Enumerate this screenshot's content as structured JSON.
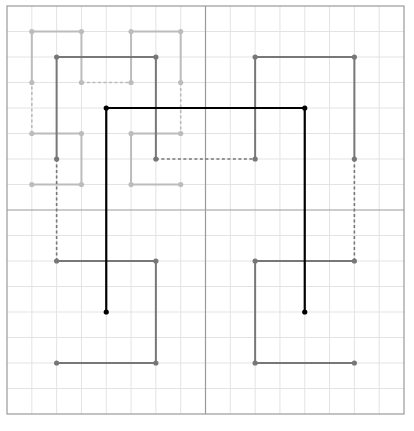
{
  "grid": {
    "cells": 16,
    "color_minor": "#e3e3e3",
    "color_frame": "#9a9a9a",
    "color_midline": "#9a9a9a"
  },
  "curves": [
    {
      "name": "order-3-partial",
      "color": "#bcbcbc",
      "points": [
        [
          1,
          7
        ],
        [
          3,
          7
        ],
        [
          3,
          5
        ],
        [
          1,
          5
        ],
        [
          1,
          3
        ],
        [
          1,
          1
        ],
        [
          3,
          1
        ],
        [
          3,
          3
        ],
        [
          5,
          3
        ],
        [
          5,
          1
        ],
        [
          7,
          1
        ],
        [
          7,
          3
        ],
        [
          7,
          5
        ],
        [
          5,
          5
        ],
        [
          5,
          7
        ],
        [
          7,
          7
        ]
      ],
      "dashed_segments": [
        3,
        7,
        11
      ]
    },
    {
      "name": "order-2",
      "color": "#777777",
      "points": [
        [
          2,
          14
        ],
        [
          6,
          14
        ],
        [
          6,
          10
        ],
        [
          2,
          10
        ],
        [
          2,
          6
        ],
        [
          2,
          2
        ],
        [
          6,
          2
        ],
        [
          6,
          6
        ],
        [
          10,
          6
        ],
        [
          10,
          2
        ],
        [
          14,
          2
        ],
        [
          14,
          6
        ],
        [
          14,
          10
        ],
        [
          10,
          10
        ],
        [
          10,
          14
        ],
        [
          14,
          14
        ]
      ],
      "dashed_segments": [
        3,
        7,
        11
      ]
    },
    {
      "name": "order-1",
      "color": "#000000",
      "points": [
        [
          4,
          12
        ],
        [
          4,
          4
        ],
        [
          12,
          4
        ],
        [
          12,
          12
        ]
      ],
      "dashed_segments": []
    }
  ]
}
